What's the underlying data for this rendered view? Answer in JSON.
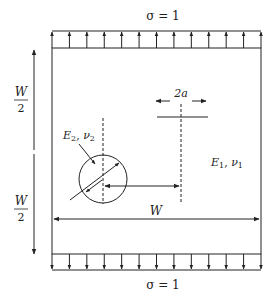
{
  "diagram": {
    "top_load_label": "σ = 1",
    "bottom_load_label": "σ = 1",
    "load_arrow_count": 13,
    "half_width_top": {
      "numerator": "W",
      "denominator": "2"
    },
    "half_width_bottom": {
      "numerator": "W",
      "denominator": "2"
    },
    "width_label": "W",
    "crack_length_label": "2a",
    "inclusion_material": {
      "E": "E",
      "E_sub": "2",
      "nu": "ν",
      "nu_sub": "2"
    },
    "matrix_material": {
      "E": "E",
      "E_sub": "1",
      "nu": "ν",
      "nu_sub": "1"
    },
    "line_color": "#222222"
  }
}
